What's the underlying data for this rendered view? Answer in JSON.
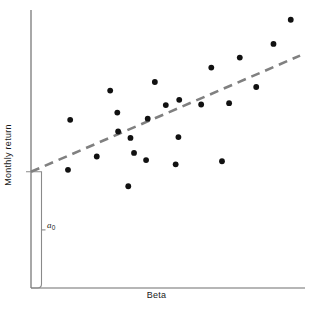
{
  "figure": {
    "background_color": "#ffffff",
    "ink_color": "#1a1a1a",
    "axis_color": "#6e6e6e",
    "trend_color": "#808080",
    "point_color": "#111111"
  },
  "labels": {
    "xlabel": "Beta",
    "ylabel": "Monthly return",
    "intercept_symbol": "a",
    "intercept_subscript": "0"
  },
  "chart_data": {
    "type": "scatter",
    "title": "",
    "xlabel": "Beta",
    "ylabel": "Monthly return",
    "xlim": [
      0,
      1
    ],
    "ylim": [
      0,
      1
    ],
    "grid": false,
    "legend": null,
    "axis_ticks": {
      "x": [],
      "y": []
    },
    "annotations": [
      {
        "name": "intercept-bracket",
        "text": "a0",
        "description": "Vertical bracket from origin up to the intercept of the fitted line on the y-axis, labelled a sub 0",
        "y_from": 0.0,
        "y_to": 0.418
      }
    ],
    "series": [
      {
        "name": "observations",
        "marker": "filled-circle",
        "marker_size_px": 5,
        "color": "#111111",
        "points": [
          {
            "x": 0.135,
            "y": 0.425
          },
          {
            "x": 0.143,
            "y": 0.605
          },
          {
            "x": 0.24,
            "y": 0.473
          },
          {
            "x": 0.289,
            "y": 0.71
          },
          {
            "x": 0.315,
            "y": 0.631
          },
          {
            "x": 0.318,
            "y": 0.563
          },
          {
            "x": 0.355,
            "y": 0.366
          },
          {
            "x": 0.363,
            "y": 0.54
          },
          {
            "x": 0.376,
            "y": 0.486
          },
          {
            "x": 0.42,
            "y": 0.46
          },
          {
            "x": 0.426,
            "y": 0.609
          },
          {
            "x": 0.452,
            "y": 0.741
          },
          {
            "x": 0.492,
            "y": 0.658
          },
          {
            "x": 0.528,
            "y": 0.445
          },
          {
            "x": 0.538,
            "y": 0.543
          },
          {
            "x": 0.541,
            "y": 0.677
          },
          {
            "x": 0.621,
            "y": 0.66
          },
          {
            "x": 0.658,
            "y": 0.793
          },
          {
            "x": 0.697,
            "y": 0.456
          },
          {
            "x": 0.723,
            "y": 0.665
          },
          {
            "x": 0.762,
            "y": 0.829
          },
          {
            "x": 0.822,
            "y": 0.723
          },
          {
            "x": 0.885,
            "y": 0.878
          },
          {
            "x": 0.948,
            "y": 0.965
          }
        ]
      }
    ],
    "trendline": {
      "name": "fitted-regression-line",
      "style": "dashed",
      "color": "#808080",
      "width_px": 2.6,
      "dash_pattern_px": [
        9,
        6
      ],
      "x_start": 0.0,
      "y_start": 0.418,
      "x_end": 0.982,
      "y_end": 0.836
    }
  }
}
